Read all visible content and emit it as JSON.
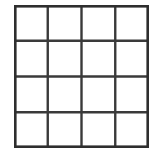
{
  "figure": {
    "type": "grid-diagram",
    "background_color": "#ffffff",
    "line_color": "#3a3a3a",
    "border_color": "#2e2e2e",
    "cell_fill_color": "#ffffff",
    "line_width_px": 2.4,
    "border_width_px": 2.6,
    "rows": 4,
    "columns": 4,
    "cell_count": 16,
    "bounds": {
      "left_px": 14,
      "top_px": 5,
      "width_px": 135,
      "height_px": 143
    },
    "vertical_line_positions": [
      0,
      33.75,
      67.5,
      101.25,
      135
    ],
    "horizontal_line_positions": [
      0,
      35.75,
      71.5,
      107.25,
      143
    ],
    "cells": [
      {
        "row": 0,
        "col": 0,
        "label": ""
      },
      {
        "row": 0,
        "col": 1,
        "label": ""
      },
      {
        "row": 0,
        "col": 2,
        "label": ""
      },
      {
        "row": 0,
        "col": 3,
        "label": ""
      },
      {
        "row": 1,
        "col": 0,
        "label": ""
      },
      {
        "row": 1,
        "col": 1,
        "label": ""
      },
      {
        "row": 1,
        "col": 2,
        "label": ""
      },
      {
        "row": 1,
        "col": 3,
        "label": ""
      },
      {
        "row": 2,
        "col": 0,
        "label": ""
      },
      {
        "row": 2,
        "col": 1,
        "label": ""
      },
      {
        "row": 2,
        "col": 2,
        "label": ""
      },
      {
        "row": 2,
        "col": 3,
        "label": ""
      },
      {
        "row": 3,
        "col": 0,
        "label": ""
      },
      {
        "row": 3,
        "col": 1,
        "label": ""
      },
      {
        "row": 3,
        "col": 2,
        "label": ""
      },
      {
        "row": 3,
        "col": 3,
        "label": ""
      }
    ]
  }
}
